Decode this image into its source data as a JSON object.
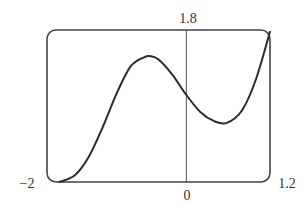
{
  "chart_data": {
    "type": "line",
    "title": "",
    "xlabel": "",
    "ylabel": "",
    "xlim": [
      -2,
      1.2
    ],
    "ylim": [
      0,
      1.8
    ],
    "grid": false,
    "legend": null,
    "axis_labels": {
      "x_min": "−2",
      "x_max": "1.2",
      "x_origin": "0",
      "y_max": "1.8"
    },
    "series": [
      {
        "name": "f(x)",
        "x": [
          -1.82,
          -1.6,
          -1.4,
          -1.2,
          -1.0,
          -0.8,
          -0.6,
          -0.52,
          -0.4,
          -0.2,
          0.0,
          0.2,
          0.4,
          0.58,
          0.8,
          1.0,
          1.2
        ],
        "y": [
          0.0,
          0.08,
          0.3,
          0.65,
          1.05,
          1.37,
          1.48,
          1.49,
          1.45,
          1.27,
          1.03,
          0.83,
          0.72,
          0.7,
          0.85,
          1.22,
          1.78
        ]
      }
    ],
    "features": {
      "local_max": {
        "x": -0.52,
        "y": 1.49
      },
      "local_min": {
        "x": 0.58,
        "y": 0.7
      },
      "y_intercept": {
        "x": 0,
        "y": 1.03
      }
    }
  },
  "colors": {
    "curve": "#2b2b2b",
    "frame": "#444444",
    "axis": "#555555",
    "text": "#333333"
  }
}
